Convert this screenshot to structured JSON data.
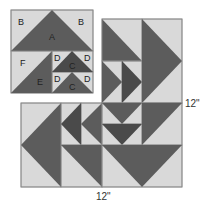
{
  "colors": {
    "dark": "#5c5c5c",
    "darker": "#4a4a4a",
    "light": "#d9d9d9",
    "border": "#8a8a8a",
    "background": "#ffffff"
  },
  "unit_block": {
    "labels": {
      "a": "A",
      "b_left": "B",
      "b_right": "B",
      "c_top": "C",
      "c_bottom": "C",
      "d_top_left": "D",
      "d_top_right": "D",
      "d_bottom_left": "D",
      "d_bottom_right": "D",
      "e": "E",
      "f": "F"
    }
  },
  "dimensions": {
    "width_label": "12\"",
    "height_label": "12\""
  }
}
